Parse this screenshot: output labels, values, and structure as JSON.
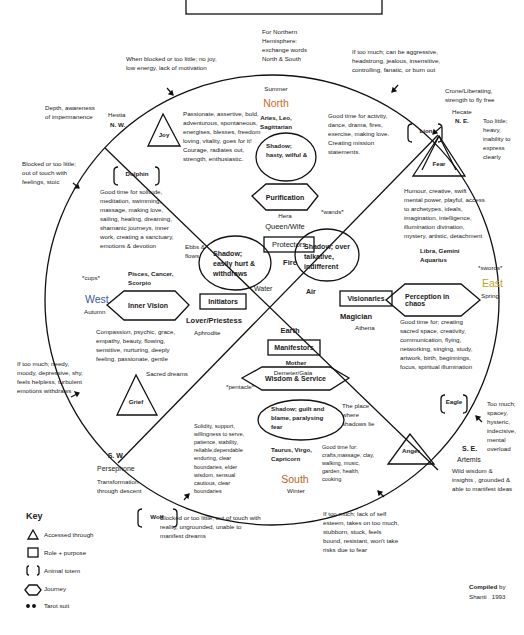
{
  "colors": {
    "north": "#d2691e",
    "south": "#b5651d",
    "east": "#c9a227",
    "west": "#3c5a99",
    "line": "#111111"
  },
  "header_note": "For Northern Hemisphere: exchange words North & South",
  "directions": {
    "north": {
      "season": "Summer",
      "label": "North",
      "signs": "Aries, Leo, Sagittarian",
      "shadow": "Shadow; hasty, wilful &",
      "journey": "Purification",
      "goddess": "Hera",
      "archetype": "Queen/Wife",
      "role": "Protectors",
      "element": "Fire",
      "suit": "*wands*",
      "qualities": "Passionate, assertive, bold, adventurous, spontaneous, energises, blesses, freedom loving, vitality, goes for it! Courage, radiates out, strength, enthusiastic.",
      "good_time": "Good time for activity, dance, drama, fires, exercise, making love. Creating mission statements.",
      "too_much": "If too much; can be aggressive, headstrong, jealous, insensitive, controlling, fanatic, or burn out"
    },
    "east": {
      "label": "East",
      "season": "Spring",
      "signs": "Libra, Gemini Aquarius",
      "shadow": "Shadow; over talkative, indifferent",
      "journey": "Perception in chaos",
      "role": "Visionaries",
      "archetype": "Magician",
      "goddess": "Athena",
      "element": "Air",
      "suit": "*swords*",
      "qualities": "Humour, creative, swift mental power, playful, access to archetypes, ideals, imagination, intelligence, illumination divination, mystery, artistic, detachment",
      "good_time": "Good time for; creating sacred space, creativity, communication, flying, networking, singing, study, artwork, birth, beginnings, focus, spiritual illumination"
    },
    "south": {
      "label": "South",
      "season": "Winter",
      "signs": "Taurus, Virgo, Capricorn",
      "shadow": "Shadow; guilt and blame, paralysing fear",
      "journey": "Wisdom & Service",
      "role": "Manifestors",
      "archetype": "Mother",
      "goddess": "Demeter/Gaia",
      "element": "Earth",
      "suit": "*pentacle*",
      "qualities": "Solidity, support, willingness to serve, patience, stability, reliable,dependable enduring, clear boundaries, elder wisdom, sensual cautious, clear boundaries",
      "good_time": "Good time for: crafts,massage, clay, walking, music, garden, health, cooking",
      "shadows_place": "The place where shadows lie",
      "too_much": "If too much; lack of self esteem, takes on too much, stubborn, stuck, feels bound, resistant, won't take risks due to fear",
      "too_little": "Blocked or too little; out of touch with reality, ungrounded, unable to manifest dreams"
    },
    "west": {
      "label": "West",
      "season": "Autumn",
      "signs": "Pisces, Cancer, Scorpio",
      "shadow": "Shadow; easily hurt & withdraws",
      "journey": "Inner Vision",
      "role": "Initiators",
      "archetype": "Lover/Priestess",
      "goddess": "Aphrodite",
      "element": "Water",
      "suit": "*cups*",
      "ebbs": "Ebbs & flows",
      "good_time": "Good time for solitude, meditation, swimming, massage, making love, sailing, healing, dreaming, shamanic journeys, inner work, creating a sanctuary, emotions & devotion",
      "qualities": "Compassion, psychic, grace, empathy, beauty, flowing, sensitive, nurturing, deeply feeling, passionate, gentle",
      "sacred": "Sacred dreams",
      "too_little": "Blocked or too little; out of touch with feelings, stoic",
      "too_much": "If too much; needy, moody, depressive, shy, feels helpless, turbulent emotions withdraws"
    }
  },
  "intercardinals": {
    "nw": {
      "label": "N. W.",
      "goddess": "Hestia",
      "theme": "Depth, awareness of impermanence",
      "emotion": "Joy",
      "totem": "Dolphin",
      "too_little": "When blocked or too little; no joy, low energy, lack of motivation"
    },
    "ne": {
      "label": "N. E.",
      "goddess": "Hecate",
      "theme": "Crone/Liberating, strength to fly free",
      "emotion": "Fear",
      "totem": "Lion",
      "too_little": "Too little; heavy, inability to express clearly"
    },
    "sw": {
      "label": "S. W.",
      "goddess": "Persephone",
      "theme": "Transformation through descent",
      "emotion": "Grief",
      "totem": "Wolf"
    },
    "se": {
      "label": "S. E.",
      "goddess": "Artemis",
      "theme": "Wild wisdom & insights , grounded & able to manifest ideas",
      "emotion": "Anger",
      "totem": "Eagle",
      "too_much": "Too much; spacey, hysteric, indecisive, mental overload"
    }
  },
  "key": {
    "title": "Key",
    "items": [
      {
        "symbol": "triangle",
        "label": "Accessed through"
      },
      {
        "symbol": "square",
        "label": "Role + purpose"
      },
      {
        "symbol": "brackets",
        "label": "Animal totem"
      },
      {
        "symbol": "hexagon",
        "label": "Journey"
      },
      {
        "symbol": "asterisks",
        "label": "Tarot suit"
      }
    ]
  },
  "credit": {
    "prefix": "Compiled",
    "suffix": "by",
    "author": "Shanti",
    "year": "1993"
  }
}
